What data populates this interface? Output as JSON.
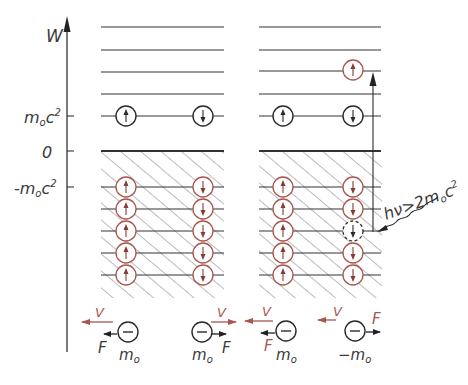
{
  "figure": {
    "colors": {
      "ink": "#333333",
      "red": "#a8564e",
      "hatch": "#555555",
      "background": "#ffffff"
    }
  },
  "axis": {
    "label": "W",
    "ticks": [
      {
        "label_main": "m",
        "label_sub": "o",
        "label_rest": "c",
        "label_sup": "2",
        "value": "m0c^2"
      },
      {
        "label_main": "0",
        "value": "0"
      },
      {
        "label_main": "-m",
        "label_sub": "o",
        "label_rest": "c",
        "label_sup": "2",
        "value": "-m0c^2"
      }
    ]
  },
  "panels": [
    {
      "name": "left",
      "positive_states": [
        {
          "spin": "up"
        },
        {
          "spin": "down"
        }
      ],
      "negative_sea_rows": 5,
      "negative_sea_spins": [
        "up",
        "down"
      ]
    },
    {
      "name": "right",
      "positive_states": [
        {
          "spin": "up"
        },
        {
          "spin": "down"
        }
      ],
      "excited_electron": {
        "spin": "up",
        "color": "red"
      },
      "hole": {
        "spin": "down",
        "row": 3,
        "style": "dashed"
      },
      "photon_label": "hν > 2m₀c²",
      "photon_label_parts": {
        "main": "hν>2m",
        "sub": "o",
        "rest": "c",
        "sup": "2"
      }
    }
  ],
  "bottom_particles": [
    {
      "symbol": "−",
      "mass_label": "m",
      "mass_sub": "o",
      "v_label": "V",
      "v_dir": "left",
      "f_label": "F",
      "f_dir": "left"
    },
    {
      "symbol": "−",
      "mass_label": "m",
      "mass_sub": "o",
      "v_label": "V",
      "v_dir": "right",
      "f_label": "F",
      "f_dir": "right"
    },
    {
      "symbol": "−",
      "mass_label": "m",
      "mass_sub": "o",
      "v_label": "V",
      "v_dir": "left",
      "f_label": "F",
      "f_dir": "left"
    },
    {
      "symbol": "−",
      "mass_label": "−m",
      "mass_sub": "o",
      "v_label": "V",
      "v_dir": "left",
      "f_label": "F",
      "f_dir": "right"
    }
  ]
}
